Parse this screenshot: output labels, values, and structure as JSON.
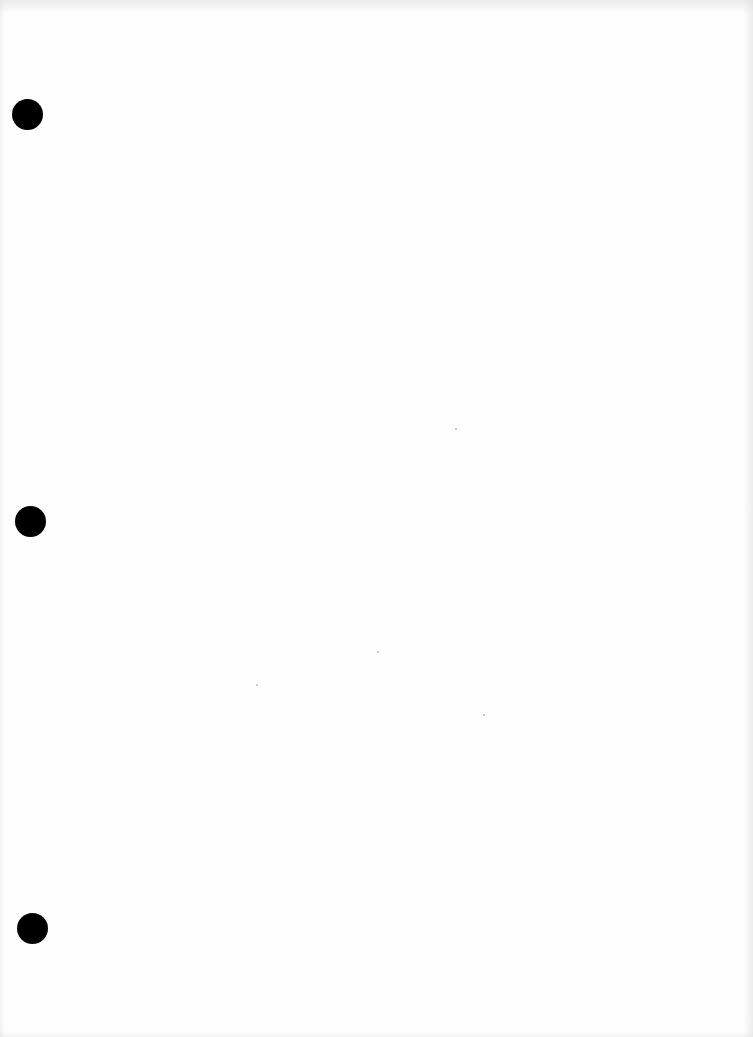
{
  "document": {
    "type": "blank scanned page",
    "background_color": "#fefefe",
    "text_content": ""
  },
  "punch_holes": [
    {
      "cx": 27,
      "cy": 114,
      "diameter": 31,
      "color": "#000000"
    },
    {
      "cx": 30,
      "cy": 521,
      "diameter": 31,
      "color": "#000000"
    },
    {
      "cx": 32,
      "cy": 928,
      "diameter": 31,
      "color": "#000000"
    }
  ],
  "specks": [
    {
      "x": 455,
      "y": 428
    },
    {
      "x": 256,
      "y": 684
    },
    {
      "x": 377,
      "y": 651
    },
    {
      "x": 483,
      "y": 714
    }
  ]
}
